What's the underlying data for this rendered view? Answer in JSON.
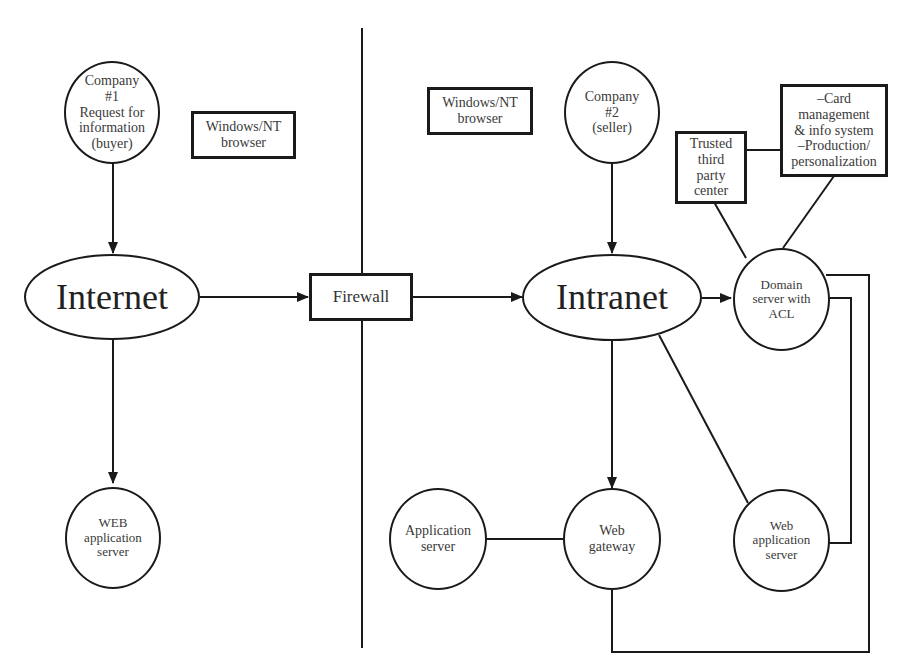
{
  "diagram": {
    "type": "network architecture diagram",
    "left_side": {
      "company1": {
        "label": "Company\n#1\nRequest for\ninformation\n(buyer)"
      },
      "browser1": {
        "label": "Windows/NT\nbrowser"
      },
      "internet": {
        "label": "Internet"
      },
      "web_app_server_left": {
        "label": "WEB\napplication\nserver"
      }
    },
    "firewall": {
      "label": "Firewall"
    },
    "right_side": {
      "browser2": {
        "label": "Windows/NT\nbrowser"
      },
      "company2": {
        "label": "Company\n#2\n(seller)"
      },
      "trusted_third_party": {
        "label": "Trusted\nthird\nparty\ncenter"
      },
      "card_management": {
        "label": "–Card\nmanagement\n& info system\n–Production/\npersonalization"
      },
      "intranet": {
        "label": "Intranet"
      },
      "domain_server": {
        "label": "Domain\nserver with\nACL"
      },
      "application_server": {
        "label": "Application\nserver"
      },
      "web_gateway": {
        "label": "Web\ngateway"
      },
      "web_app_server_right": {
        "label": "Web\napplication\nserver"
      }
    },
    "edges": [
      {
        "from": "Company #1",
        "to": "Internet",
        "arrow": true
      },
      {
        "from": "Internet",
        "to": "WEB application server",
        "arrow": true
      },
      {
        "from": "Internet",
        "to": "Firewall",
        "arrow": true
      },
      {
        "from": "Firewall",
        "to": "Intranet",
        "arrow": true
      },
      {
        "from": "Company #2",
        "to": "Intranet",
        "arrow": true
      },
      {
        "from": "Intranet",
        "to": "Domain server with ACL",
        "arrow": true
      },
      {
        "from": "Intranet",
        "to": "Web gateway",
        "arrow": true
      },
      {
        "from": "Intranet",
        "to": "Web application server",
        "arrow": false
      },
      {
        "from": "Trusted third party center",
        "to": "Card management & info system",
        "arrow": false
      },
      {
        "from": "Trusted third party center",
        "to": "Domain server with ACL",
        "arrow": false
      },
      {
        "from": "Card management & info system",
        "to": "Domain server with ACL",
        "arrow": false
      },
      {
        "from": "Application server",
        "to": "Web gateway",
        "arrow": false
      },
      {
        "from": "Domain server with ACL",
        "to": "Web application server",
        "arrow": false
      },
      {
        "from": "Domain server with ACL",
        "to": "Web gateway",
        "arrow": false
      }
    ]
  }
}
